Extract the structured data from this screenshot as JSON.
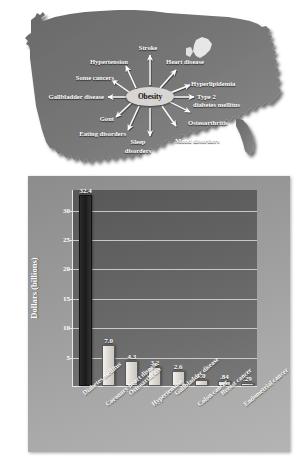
{
  "figure": {
    "map_region": "United States outline",
    "center_node": "Obesity"
  },
  "diagram": {
    "center": "Obesity",
    "conditions": [
      {
        "label": "Stroke",
        "x": 148,
        "y": 46,
        "align": "ctr"
      },
      {
        "label": "Heart disease",
        "x": 164,
        "y": 60,
        "align": "left"
      },
      {
        "label": "Hyperlipidemia",
        "x": 178,
        "y": 79,
        "align": "left"
      },
      {
        "label": "Type 2",
        "x": 185,
        "y": 94,
        "align": "left"
      },
      {
        "label": "diabetes mellitus",
        "x": 183,
        "y": 102,
        "align": "left"
      },
      {
        "label": "Osteoarthritis",
        "x": 173,
        "y": 119,
        "align": "left"
      },
      {
        "label": "Mood disorders",
        "x": 164,
        "y": 140,
        "align": "left"
      },
      {
        "label": "Sleep",
        "x": 137,
        "y": 140,
        "align": "ctr"
      },
      {
        "label": "disorders",
        "x": 137,
        "y": 148,
        "align": "ctr"
      },
      {
        "label": "Eating disorders",
        "x": 122,
        "y": 130,
        "align": "rgt"
      },
      {
        "label": "Gout",
        "x": 112,
        "y": 116,
        "align": "rgt"
      },
      {
        "label": "Gallbladder disease",
        "x": 116,
        "y": 95,
        "align": "rgt"
      },
      {
        "label": "Some cancers",
        "x": 119,
        "y": 75,
        "align": "rgt"
      },
      {
        "label": "Hypertension",
        "x": 131,
        "y": 59,
        "align": "rgt"
      }
    ]
  },
  "chart_data": {
    "type": "bar",
    "title": "",
    "xlabel": "",
    "ylabel": "Dollars (billions)",
    "ylim": [
      0,
      33.5
    ],
    "yticks": [
      5,
      10,
      15,
      20,
      25,
      30
    ],
    "ytick_labels": [
      "5",
      "10",
      "15",
      "20",
      "25",
      "30"
    ],
    "grid": true,
    "legend": "none",
    "categories": [
      "Diabetes mellitus",
      "Coronary heart disease",
      "Osteoarthritis",
      "Hypertension",
      "Gallbladder disease",
      "Colon cancer",
      "Breast cancer",
      "Endometrial cancer"
    ],
    "values": [
      32.4,
      7.0,
      4.3,
      3.2,
      2.6,
      1.0,
      0.84,
      0.29
    ],
    "value_labels": [
      "32.4",
      "7.0",
      "4.3",
      "3.2",
      "2.6",
      "1.0",
      ".84",
      ".29"
    ],
    "bar_colors": [
      "#1f1f1f",
      "#e2dfd9",
      "#e2dfd9",
      "#e2dfd9",
      "#e2dfd9",
      "#e2dfd9",
      "#e2dfd9",
      "#e2dfd9"
    ],
    "highlight_index": 0
  },
  "colors": {
    "panel_bg": "#9a9a9a",
    "plot_bg": "#636363",
    "grid": "#d9d9d9",
    "axis": "#e8e8e8",
    "text": "#ffffff",
    "map_fill": "#6f6f6f",
    "node_fill": "#d8d6d2",
    "bar_light": "#e2dfd9",
    "bar_dark": "#1f1f1f"
  }
}
